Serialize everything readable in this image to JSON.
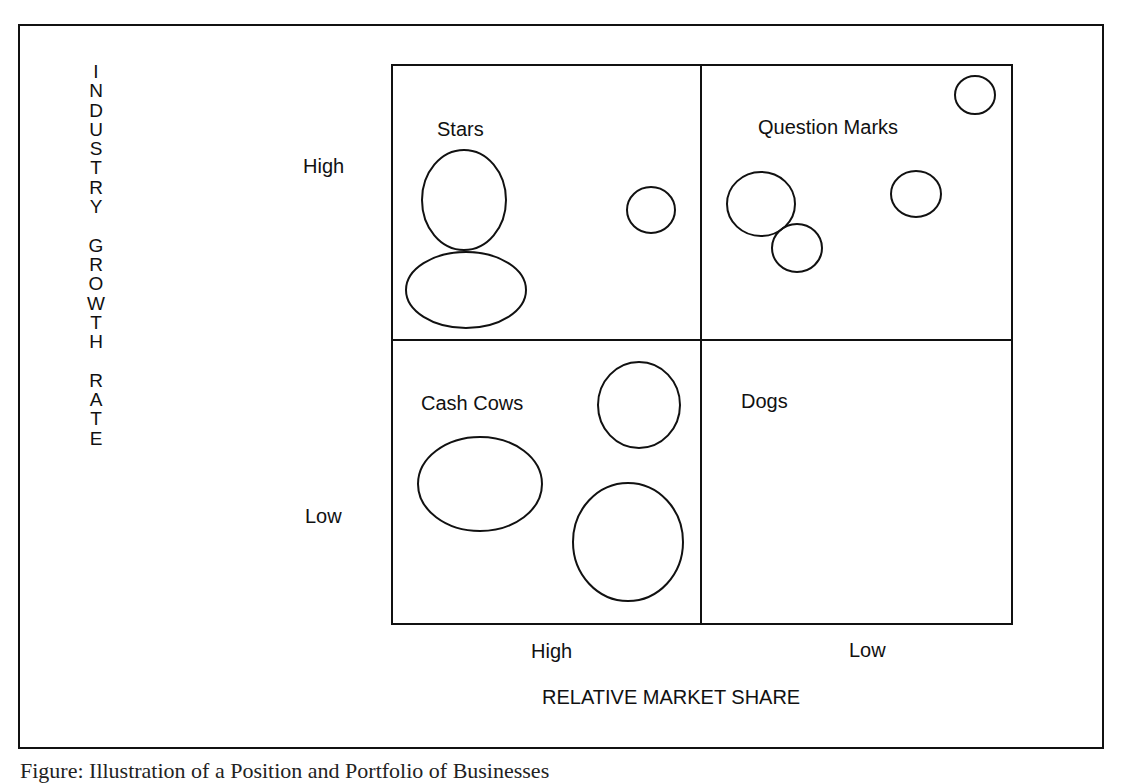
{
  "diagram": {
    "type": "bcg-growth-share-matrix",
    "y_axis": {
      "title": "INDUSTRY GROWTH RATE",
      "title_letters": [
        "I",
        "N",
        "D",
        "U",
        "S",
        "T",
        "R",
        "Y",
        " ",
        "G",
        "R",
        "O",
        "W",
        "T",
        "H",
        " ",
        "R",
        "A",
        "T",
        "E"
      ],
      "ticks": [
        "High",
        "Low"
      ]
    },
    "x_axis": {
      "title": "RELATIVE MARKET SHARE",
      "ticks": [
        "High",
        "Low"
      ]
    },
    "quadrants": [
      {
        "label": "Stars",
        "position": "top-left"
      },
      {
        "label": "Question Marks",
        "position": "top-right"
      },
      {
        "label": "Cash Cows",
        "position": "bottom-left"
      },
      {
        "label": "Dogs",
        "position": "bottom-right"
      }
    ],
    "bubbles": [
      {
        "quadrant": "Stars",
        "cx": 464,
        "cy": 200,
        "rx": 42,
        "ry": 50
      },
      {
        "quadrant": "Stars",
        "cx": 466,
        "cy": 290,
        "rx": 60,
        "ry": 38
      },
      {
        "quadrant": "Stars",
        "cx": 651,
        "cy": 210,
        "rx": 24,
        "ry": 23
      },
      {
        "quadrant": "Question Marks",
        "cx": 975,
        "cy": 95,
        "rx": 20,
        "ry": 19
      },
      {
        "quadrant": "Question Marks",
        "cx": 761,
        "cy": 204,
        "rx": 34,
        "ry": 32
      },
      {
        "quadrant": "Question Marks",
        "cx": 797,
        "cy": 248,
        "rx": 25,
        "ry": 24
      },
      {
        "quadrant": "Question Marks",
        "cx": 916,
        "cy": 194,
        "rx": 25,
        "ry": 23
      },
      {
        "quadrant": "Cash Cows",
        "cx": 639,
        "cy": 405,
        "rx": 41,
        "ry": 43
      },
      {
        "quadrant": "Cash Cows",
        "cx": 480,
        "cy": 484,
        "rx": 62,
        "ry": 47
      },
      {
        "quadrant": "Cash Cows",
        "cx": 628,
        "cy": 542,
        "rx": 55,
        "ry": 59
      }
    ]
  },
  "caption": "Figure: Illustration of a Position and Portfolio of Businesses"
}
